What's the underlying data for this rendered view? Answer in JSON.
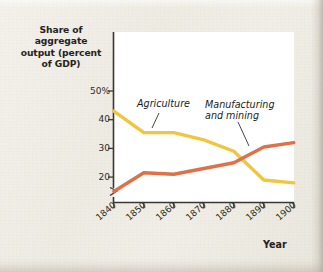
{
  "figure": {
    "background_color": "#efece5",
    "plot_background_color": "#ffffff",
    "axis_color": "#3b3833"
  },
  "axes": {
    "y_title": "Share of aggregate output (percent of GDP)",
    "y_title_lines": [
      "Share of",
      "aggregate",
      "output (percent",
      "of GDP)"
    ],
    "x_title": "Year",
    "y_ticks": [
      "50%",
      "40",
      "30",
      "20"
    ],
    "y_tick_values": [
      50,
      40,
      30,
      20
    ],
    "x_ticks": [
      "1840",
      "1850",
      "1860",
      "1870",
      "1880",
      "1890",
      "1900"
    ],
    "y_axis_break": true
  },
  "series_labels": {
    "agriculture": "Agriculture",
    "manufacturing_line1": "Manufacturing",
    "manufacturing_line2": "and mining"
  },
  "chart_data": {
    "type": "line",
    "title": "",
    "xlabel": "Year",
    "ylabel": "Share of aggregate output (percent of GDP)",
    "x": [
      1840,
      1850,
      1860,
      1870,
      1880,
      1890,
      1900
    ],
    "xlim": [
      1840,
      1900
    ],
    "ylim": [
      13,
      52
    ],
    "ytick_values": [
      50,
      40,
      30,
      20
    ],
    "ytick_labels": [
      "50%",
      "40",
      "30",
      "20"
    ],
    "grid": false,
    "legend": "inline-annotations",
    "series": [
      {
        "name": "Agriculture",
        "color": "#f2c53f",
        "values": [
          43.0,
          35.5,
          35.5,
          33.0,
          29.0,
          19.0,
          18.0
        ]
      },
      {
        "name": "Manufacturing and mining",
        "color": "#df7048",
        "values": [
          15.0,
          21.5,
          21.0,
          23.0,
          25.0,
          30.5,
          32.0
        ]
      }
    ],
    "annotations": [
      {
        "text": "Agriculture",
        "target_series": "Agriculture",
        "target_x": 1857
      },
      {
        "text": "Manufacturing and mining",
        "target_series": "Manufacturing and mining",
        "target_x": 1887
      }
    ]
  }
}
